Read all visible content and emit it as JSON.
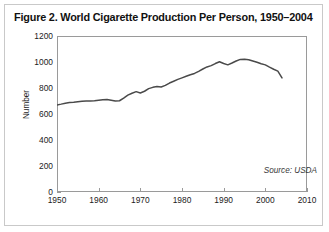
{
  "figure": {
    "title": "Figure 2. World Cigarette Production Per Person, 1950–2004",
    "source_note": "Source: USDA",
    "line_color": "#4a4a4a",
    "frame_color": "#9a9a9a",
    "border_color": "#c9c9c9",
    "background": "#ffffff"
  },
  "chart_data": {
    "type": "line",
    "title": "Figure 2. World Cigarette Production Per Person, 1950–2004",
    "xlabel": "",
    "ylabel": "Number",
    "xlim": [
      1950,
      2010
    ],
    "ylim": [
      0,
      1200
    ],
    "xticks": [
      1950,
      1960,
      1970,
      1980,
      1990,
      2000,
      2010
    ],
    "yticks": [
      0,
      200,
      400,
      600,
      800,
      1000,
      1200
    ],
    "grid": false,
    "legend": "none",
    "annotations": [
      "Source: USDA"
    ],
    "series": [
      {
        "name": "World cigarette production per person",
        "x": [
          1950,
          1951,
          1952,
          1953,
          1954,
          1955,
          1956,
          1957,
          1958,
          1959,
          1960,
          1961,
          1962,
          1963,
          1964,
          1965,
          1966,
          1967,
          1968,
          1969,
          1970,
          1971,
          1972,
          1973,
          1974,
          1975,
          1976,
          1977,
          1978,
          1979,
          1980,
          1981,
          1982,
          1983,
          1984,
          1985,
          1986,
          1987,
          1988,
          1989,
          1990,
          1991,
          1992,
          1993,
          1994,
          1995,
          1996,
          1997,
          1998,
          1999,
          2000,
          2001,
          2002,
          2003,
          2004
        ],
        "values": [
          670,
          676,
          683,
          688,
          690,
          694,
          698,
          700,
          700,
          702,
          706,
          710,
          712,
          706,
          700,
          702,
          722,
          745,
          760,
          772,
          762,
          775,
          795,
          805,
          812,
          808,
          820,
          838,
          852,
          866,
          878,
          890,
          902,
          912,
          928,
          946,
          962,
          972,
          988,
          1002,
          988,
          978,
          992,
          1008,
          1020,
          1022,
          1018,
          1008,
          998,
          986,
          978,
          960,
          944,
          930,
          878
        ]
      }
    ]
  },
  "axes": {
    "y_label": "Number",
    "y_ticks": [
      {
        "value": 1200,
        "label": "1200"
      },
      {
        "value": 1000,
        "label": "1000"
      },
      {
        "value": 800,
        "label": "800"
      },
      {
        "value": 600,
        "label": "600"
      },
      {
        "value": 400,
        "label": "400"
      },
      {
        "value": 200,
        "label": "200"
      },
      {
        "value": 0,
        "label": "0"
      }
    ],
    "x_ticks": [
      {
        "value": 1950,
        "label": "1950"
      },
      {
        "value": 1960,
        "label": "1960"
      },
      {
        "value": 1970,
        "label": "1970"
      },
      {
        "value": 1980,
        "label": "1980"
      },
      {
        "value": 1990,
        "label": "1990"
      },
      {
        "value": 2000,
        "label": "2000"
      },
      {
        "value": 2010,
        "label": "2010"
      }
    ]
  }
}
